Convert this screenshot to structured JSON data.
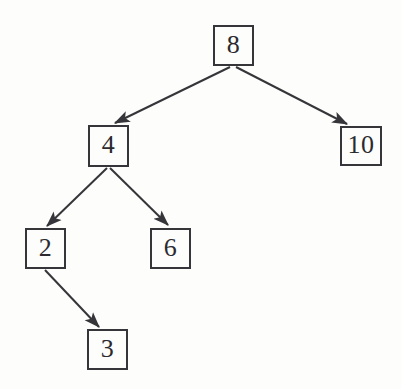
{
  "diagram": {
    "type": "binary-search-tree",
    "canvas": {
      "width": 401,
      "height": 389
    },
    "style": {
      "background_color": "#fdfdfb",
      "ink_color": "#36353a",
      "text_color": "#2b2a2f",
      "node_shape": "rectangle",
      "edge_style": "straight-arrow"
    },
    "nodes": [
      {
        "id": "n8",
        "label": "8",
        "x": 213,
        "y": 25,
        "w": 41,
        "h": 41,
        "role": "root"
      },
      {
        "id": "n4",
        "label": "4",
        "x": 88,
        "y": 125,
        "w": 41,
        "h": 42,
        "role": "left-child"
      },
      {
        "id": "n10",
        "label": "10",
        "x": 340,
        "y": 126,
        "w": 42,
        "h": 40,
        "role": "right-child"
      },
      {
        "id": "n2",
        "label": "2",
        "x": 25,
        "y": 228,
        "w": 41,
        "h": 41,
        "role": "left-child"
      },
      {
        "id": "n6",
        "label": "6",
        "x": 150,
        "y": 228,
        "w": 41,
        "h": 41,
        "role": "right-child"
      },
      {
        "id": "n3",
        "label": "3",
        "x": 87,
        "y": 329,
        "w": 41,
        "h": 41,
        "role": "right-child"
      }
    ],
    "edges": [
      {
        "id": "e8-4",
        "from": "n8",
        "to": "n4",
        "x1": 230,
        "y1": 67,
        "x2": 115,
        "y2": 123
      },
      {
        "id": "e8-10",
        "from": "n8",
        "to": "n10",
        "x1": 236,
        "y1": 67,
        "x2": 347,
        "y2": 124
      },
      {
        "id": "e4-2",
        "from": "n4",
        "to": "n2",
        "x1": 107,
        "y1": 168,
        "x2": 47,
        "y2": 226
      },
      {
        "id": "e4-6",
        "from": "n4",
        "to": "n6",
        "x1": 110,
        "y1": 168,
        "x2": 168,
        "y2": 225
      },
      {
        "id": "e2-3",
        "from": "n2",
        "to": "n3",
        "x1": 45,
        "y1": 270,
        "x2": 99,
        "y2": 327
      }
    ]
  }
}
